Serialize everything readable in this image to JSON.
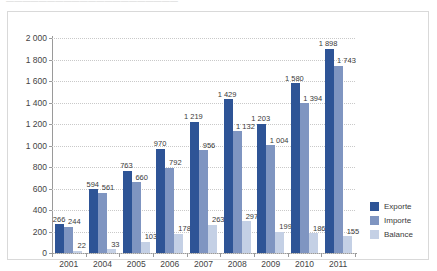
{
  "caption": {
    "text": "—————————————————————"
  },
  "colors": {
    "exporte": "#2e5496",
    "importe": "#7f95c1",
    "balance": "#c4d0e5",
    "axis": "#9a9a9a",
    "grid": "#c9c9c9",
    "frame": "#d9d9d9"
  },
  "legend": {
    "position": "right",
    "items": [
      {
        "label": "Exporte",
        "color": "#2e5496",
        "key": "exporte"
      },
      {
        "label": "Importe",
        "color": "#7f95c1",
        "key": "importe"
      },
      {
        "label": "Balance",
        "color": "#c4d0e5",
        "key": "balance"
      }
    ]
  },
  "chart_data": {
    "type": "bar",
    "title": "",
    "xlabel": "",
    "ylabel": "",
    "ylim": [
      0,
      2000
    ],
    "ystep": 200,
    "grid": true,
    "legend_position": "right",
    "categories": [
      "2001",
      "2004",
      "2005",
      "2006",
      "2007",
      "2008",
      "2009",
      "2010",
      "2011"
    ],
    "ytick_labels": [
      "0",
      "200",
      "400",
      "600",
      "800",
      "1 000",
      "1 200",
      "1 400",
      "1 600",
      "1 800",
      "2 000"
    ],
    "series": [
      {
        "name": "Exporte",
        "color": "#2e5496",
        "values": [
          266,
          594,
          763,
          970,
          1219,
          1429,
          1203,
          1580,
          1898
        ],
        "labels": [
          "266",
          "594",
          "763",
          "970",
          "1 219",
          "1 429",
          "1 203",
          "1 580",
          "1 898"
        ]
      },
      {
        "name": "Importe",
        "color": "#7f95c1",
        "values": [
          244,
          561,
          660,
          792,
          956,
          1132,
          1004,
          1394,
          1743
        ],
        "labels": [
          "244",
          "561",
          "660",
          "792",
          "956",
          "1 132",
          "1 004",
          "1 394",
          "1 743"
        ]
      },
      {
        "name": "Balance",
        "color": "#c4d0e5",
        "values": [
          22,
          33,
          103,
          178,
          263,
          297,
          199,
          186,
          155
        ],
        "labels": [
          "22",
          "33",
          "103",
          "178",
          "263",
          "297",
          "199",
          "186",
          "155"
        ]
      }
    ]
  }
}
